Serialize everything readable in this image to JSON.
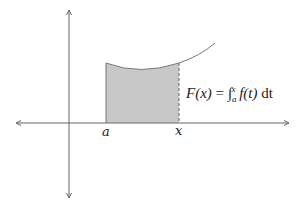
{
  "diagram": {
    "labels": {
      "a": "a",
      "x": "x"
    },
    "formula": {
      "lhs": "F(x)",
      "equals": "=",
      "integral_sign": "∫",
      "lower_limit": "a",
      "upper_limit": "x",
      "integrand": "f(t)",
      "differential": "dt",
      "full_text": "F(x) = ∫_a^x f(t) dt"
    },
    "colors": {
      "axis": "#555555",
      "curve": "#777777",
      "shade": "#c8c8c8",
      "text": "#222222"
    }
  }
}
